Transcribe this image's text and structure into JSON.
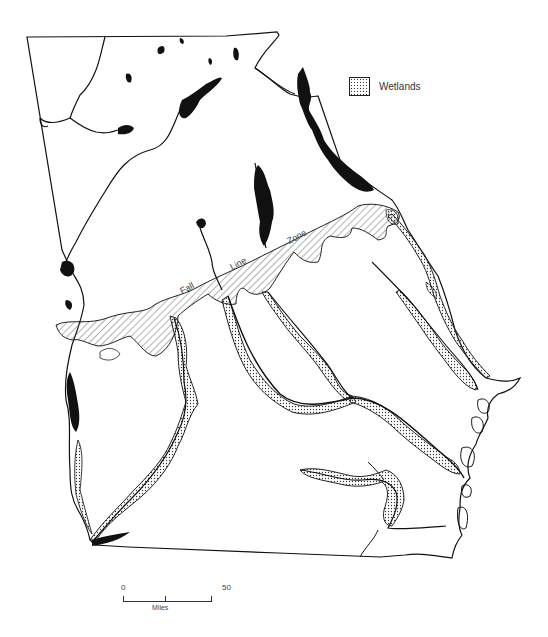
{
  "map": {
    "subject": "Georgia rivers, reservoirs, wetlands and Fall Line Zone",
    "legend": {
      "items": [
        {
          "pattern": "stipple",
          "label": "Wetlands"
        }
      ]
    },
    "annotations": {
      "fall_line_words": [
        "Fall",
        "Line",
        "Zone"
      ]
    },
    "scale_bar": {
      "start_label": "0",
      "end_label": "50",
      "unit_label": "Miles"
    },
    "colors": {
      "background": "#ffffff",
      "ink": "#111111",
      "hatch": "#555555",
      "stipple": "#333333"
    }
  }
}
